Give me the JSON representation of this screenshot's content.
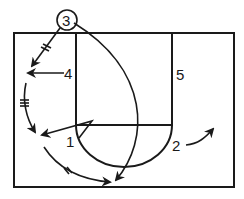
{
  "diagram": {
    "type": "basketball-play-diagram",
    "court": {
      "outer": {
        "x": 14,
        "y": 33,
        "w": 220,
        "h": 154
      },
      "lane": {
        "x": 76,
        "y": 33,
        "w": 96,
        "h": 92
      },
      "free_throw_circle": {
        "cx": 124,
        "cy": 125,
        "r": 48
      }
    },
    "players": [
      {
        "id": "3",
        "label": "3",
        "x": 67,
        "y": 20,
        "circled": true
      },
      {
        "id": "4",
        "label": "4",
        "x": 69,
        "y": 79
      },
      {
        "id": "5",
        "label": "5",
        "x": 180,
        "y": 80
      },
      {
        "id": "1",
        "label": "1",
        "x": 69,
        "y": 146
      },
      {
        "id": "2",
        "label": "2",
        "x": 177,
        "y": 150
      }
    ],
    "legend": {
      "arrow": "player movement",
      "hash_arrow": "pass",
      "colors": {
        "ink": "#1a1a1a",
        "background": "#ffffff"
      }
    }
  }
}
